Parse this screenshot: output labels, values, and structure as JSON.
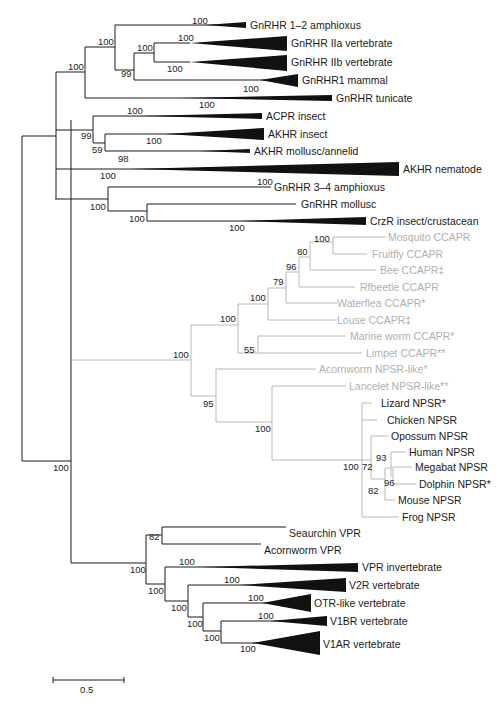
{
  "figure": {
    "type": "phylogenetic-tree",
    "scale_bar": {
      "label": "0.5"
    },
    "colors": {
      "main_branch": "#1a1a1a",
      "ccapr_npsr_branch": "#b8b8b8",
      "collapsed_clade": "#111111"
    }
  },
  "taxa": {
    "gnrhr_12_amphioxus": "GnRHR 1–2 amphioxus",
    "gnrhr_iia_vertebrate": "GnRHR IIa vertebrate",
    "gnrhr_iib_vertebrate": "GnRHR IIb vertebrate",
    "gnrhr1_mammal": "GnRHR1 mammal",
    "gnrhr_tunicate": "GnRHR tunicate",
    "acpr_insect": "ACPR insect",
    "akhr_insect": "AKHR insect",
    "akhr_mollusc_annelid": "AKHR mollusc/annelid",
    "akhr_nematode": "AKHR nematode",
    "gnrhr_34_amphioxus": "GnRHR 3–4 amphioxus",
    "gnrhr_mollusc": "GnRHR mollusc",
    "crzr_insect_crustacean": "CrzR insect/crustacean",
    "mosquito_ccapr": "Mosquito CCAPR",
    "fruitfly_ccapr": "Fruitfly CCAPR",
    "bee_ccapr": "Bee CCAPR‡",
    "rfbeetle_ccapr": "Rfbeetle CCAPR",
    "waterflea_ccapr": "Waterflea CCAPR*",
    "louse_ccapr": "Louse CCAPR‡",
    "marine_worm_ccapr": "Marine worm CCAPR*",
    "limpet_ccapr": "Limpet CCAPR**",
    "acornworm_npsr_like": "Acornworm NPSR-like*",
    "lancelet_npsr_like": "Lancelet NPSR-like**",
    "lizard_npsr": "Lizard NPSR*",
    "chicken_npsr": "Chicken NPSR",
    "opossum_npsr": "Opossum NPSR",
    "human_npsr": "Human NPSR",
    "megabat_npsr": "Megabat NPSR",
    "dolphin_npsr": "Dolphin NPSR*",
    "mouse_npsr": "Mouse NPSR",
    "frog_npsr": "Frog NPSR",
    "seaurchin_vpr": "Seaurchin VPR",
    "acornworm_vpr": "Acornworm VPR",
    "vpr_invertebrate": "VPR invertebrate",
    "v2r_vertebrate": "V2R vertebrate",
    "otr_like_vertebrate": "OTR-like vertebrate",
    "v1br_vertebrate": "V1BR vertebrate",
    "v1ar_vertebrate": "V1AR vertebrate"
  },
  "bootstrap": {
    "b_amphioxus12": "100",
    "b_iia": "100",
    "b_iia_iib": "100",
    "b_iib": "100",
    "b_gnrh_a": "100",
    "b_gnrh_b": "99",
    "b_mammal": "100",
    "b_gnrh_top": "100",
    "b_tunicate": "100",
    "b_acpr": "100",
    "b_acpr_akhr": "99",
    "b_akhr_insect": "100",
    "b_akhr_group": "59",
    "b_akhr_mollusc": "98",
    "b_nematode": "100",
    "b_amphioxus34": "100",
    "b_gnrh34_group": "100",
    "b_mollusc_crz": "100",
    "b_crz": "100",
    "b_mosq_fly": "100",
    "b_bee": "80",
    "b_rfbeetle": "96",
    "b_waterflea": "79",
    "b_louse": "100",
    "b_arthropod": "100",
    "b_lophotroch": "55",
    "b_ccapr_npsr": "100",
    "b_npsr_like": "95",
    "b_npsr_lancelet": "100",
    "b_vert_npsr": "100",
    "b_mammal_npsr": "72",
    "b_human_group": "93",
    "b_megabat_dolphin": "96",
    "b_mouse_group": "82",
    "b_root": "100",
    "b_seaurchin_acornworm": "82",
    "b_vpr_all": "100",
    "b_vpr_invert": "100",
    "b_vpr_group": "100",
    "b_v2r": "100",
    "b_v2r_group": "100",
    "b_otr": "100",
    "b_otr_group": "100",
    "b_v1br": "100",
    "b_v1_group": "100",
    "b_v1ar": "100"
  }
}
